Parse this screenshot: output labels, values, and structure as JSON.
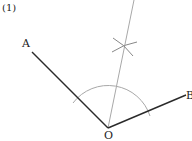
{
  "problem_number": "(1)",
  "points": {
    "A": {
      "label": "A"
    },
    "B": {
      "label": "B"
    },
    "O": {
      "label": "O"
    }
  },
  "colors": {
    "ray": "#2a2a2a",
    "construction": "#a8a8a8",
    "text": "#222222"
  }
}
